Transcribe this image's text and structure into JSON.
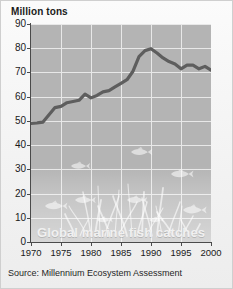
{
  "figure": {
    "y_axis_unit_label": "Million tons",
    "in_chart_caption": "Global marine fish catches",
    "source_note": "Source: Millennium Ecosystem Assessment",
    "colors": {
      "plot_background": "#b4b4b4",
      "page_background": "#f4f4f4",
      "gridline": "#e8e8e8",
      "series_line": "#5e5e5e",
      "axis": "#4a4a4a",
      "caption_text": "#f0f0f0",
      "tick_text": "#1a1a1a"
    }
  },
  "chart_data": {
    "type": "line",
    "title": "Global marine fish catches",
    "xlabel": "",
    "ylabel": "Million tons",
    "xlim": [
      1970,
      2000
    ],
    "ylim": [
      0,
      90
    ],
    "ytick_labels": [
      "0",
      "10",
      "20",
      "30",
      "40",
      "50",
      "60",
      "70",
      "80",
      "90"
    ],
    "ytick_values": [
      0,
      10,
      20,
      30,
      40,
      50,
      60,
      70,
      80,
      90
    ],
    "xtick_labels": [
      "1970",
      "1975",
      "1980",
      "1985",
      "1990",
      "1995",
      "2000"
    ],
    "xtick_values": [
      1970,
      1975,
      1980,
      1985,
      1990,
      1995,
      2000
    ],
    "grid": true,
    "legend": "none",
    "series": [
      {
        "name": "Global marine fish catches",
        "color": "#5e5e5e",
        "x": [
          1970,
          1971,
          1972,
          1973,
          1974,
          1975,
          1976,
          1977,
          1978,
          1979,
          1980,
          1981,
          1982,
          1983,
          1984,
          1985,
          1986,
          1987,
          1988,
          1989,
          1990,
          1991,
          1992,
          1993,
          1994,
          1995,
          1996,
          1997,
          1998,
          1999,
          2000
        ],
        "values": [
          49.0,
          49.2,
          49.5,
          52.5,
          55.5,
          56.0,
          57.5,
          58.0,
          58.5,
          61.0,
          59.5,
          60.5,
          62.0,
          62.5,
          64.0,
          65.5,
          67.0,
          70.5,
          76.5,
          79.0,
          79.8,
          78.0,
          76.0,
          74.5,
          73.5,
          71.5,
          73.0,
          73.0,
          71.5,
          72.5,
          71.0
        ]
      }
    ],
    "annotations": [
      {
        "kind": "decorative-fish",
        "note": "faint fish silhouettes in plot background"
      },
      {
        "kind": "decorative-seaweed",
        "note": "faint seaweed silhouettes along plot floor"
      }
    ]
  }
}
